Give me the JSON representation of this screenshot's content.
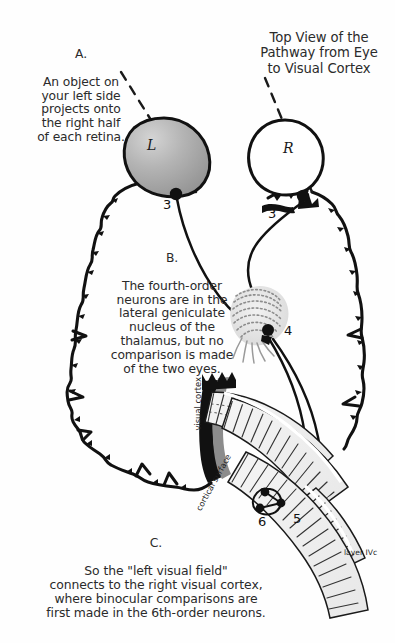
{
  "figure": {
    "title": "Top View of the\nPathway from Eye\nto Visual Cortex",
    "background_color": "#fefefe",
    "ink_color": "#111111"
  },
  "captions": {
    "a": {
      "label": "A.",
      "text": "An object on\nyour left side\nprojects onto\nthe right half\nof each retina."
    },
    "b": {
      "label": "B.",
      "text": "The fourth-order\nneurons are in the\nlateral geniculate\nnucleus of the\nthalamus, but no\ncomparison is made\nof the two eyes."
    },
    "c": {
      "label": "C.",
      "text": "So the \"left visual field\"\nconnects to the right visual cortex,\nwhere binocular comparisons are\nfirst made in the 6th-order neurons."
    }
  },
  "anatomy": {
    "left_eye_letter": "L",
    "right_eye_letter": "R",
    "left_eye_fill": "#a9a9a9",
    "right_eye_fill": "#ffffff",
    "visual_cortex_label": "visual cortex",
    "cortical_surface_label": "cortical surface",
    "layer_label": "layer\nIVc"
  },
  "neuron_order_labels": {
    "left_retina": "3",
    "right_retina": "3",
    "lgn": "4",
    "cortex_layer_ivc": "5",
    "cortex_binocular": "6"
  }
}
